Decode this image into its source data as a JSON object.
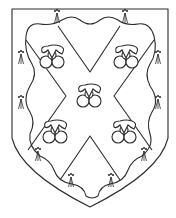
{
  "image": {
    "title": "Heraldic shield",
    "description": "Ermine field, a saltire within a wavy bordure-like border, charged with five clover-like charges (trefoils/cups)",
    "colors": {
      "stroke": "#2b2b2b",
      "background": "#ffffff"
    }
  },
  "shield": {
    "outline": "M12 9 L168 9 L168 138 Q160 172 90 207 Q20 172 12 138 Z",
    "ermine_spots": [
      {
        "x": 57,
        "y": 14
      },
      {
        "x": 125,
        "y": 14
      },
      {
        "x": 21,
        "y": 55
      },
      {
        "x": 158,
        "y": 55
      },
      {
        "x": 21,
        "y": 100
      },
      {
        "x": 158,
        "y": 100
      },
      {
        "x": 38,
        "y": 152
      },
      {
        "x": 144,
        "y": 152
      },
      {
        "x": 71,
        "y": 178
      },
      {
        "x": 111,
        "y": 178
      }
    ],
    "charges": [
      {
        "x": 52,
        "y": 58
      },
      {
        "x": 126,
        "y": 58
      },
      {
        "x": 89,
        "y": 97
      },
      {
        "x": 55,
        "y": 133
      },
      {
        "x": 124,
        "y": 133
      }
    ]
  }
}
